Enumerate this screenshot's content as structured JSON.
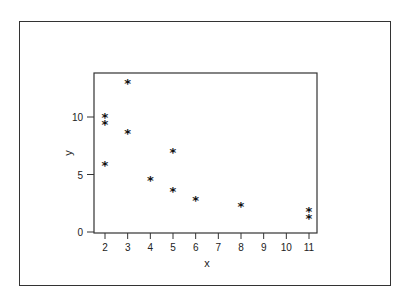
{
  "chart_data": {
    "type": "scatter",
    "title": "",
    "xlabel": "x",
    "ylabel": "y",
    "marker": "*",
    "x_ticks": [
      2,
      3,
      4,
      5,
      6,
      7,
      8,
      9,
      10,
      11
    ],
    "y_ticks": [
      0,
      5,
      10
    ],
    "xlim": [
      1.6,
      11.4
    ],
    "ylim": [
      0,
      14.2
    ],
    "grid": false,
    "legend": null,
    "points": [
      {
        "x": 2,
        "y": 10.0
      },
      {
        "x": 2,
        "y": 9.4
      },
      {
        "x": 2,
        "y": 5.8
      },
      {
        "x": 3,
        "y": 13.0
      },
      {
        "x": 3,
        "y": 8.6
      },
      {
        "x": 4,
        "y": 4.5
      },
      {
        "x": 5,
        "y": 7.0
      },
      {
        "x": 5,
        "y": 3.6
      },
      {
        "x": 6,
        "y": 2.8
      },
      {
        "x": 8,
        "y": 2.3
      },
      {
        "x": 11,
        "y": 1.8
      },
      {
        "x": 11,
        "y": 1.2
      }
    ]
  }
}
